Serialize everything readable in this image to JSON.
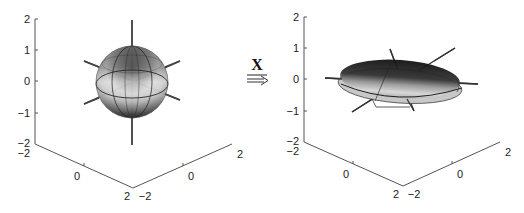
{
  "figure": {
    "left_panel": {
      "name": "unit-sphere",
      "z_ticks": [
        "2",
        "1",
        "0",
        "−1",
        "−2"
      ],
      "x_ticks": [
        "−2",
        "0",
        "2"
      ],
      "y_ticks": [
        "−2",
        "0",
        "2"
      ]
    },
    "transform": {
      "label": "X",
      "arrow": "⇒"
    },
    "right_panel": {
      "name": "ellipsoid",
      "z_ticks": [
        "2",
        "1",
        "0",
        "−1",
        "−2"
      ],
      "x_ticks": [
        "−2",
        "0",
        "2"
      ],
      "y_ticks": [
        "−2",
        "0",
        "2"
      ]
    }
  }
}
